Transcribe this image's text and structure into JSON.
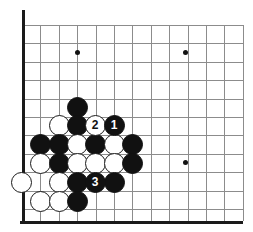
{
  "figure": {
    "kind": "go-board-diagram",
    "board_size_visible": {
      "cols": 13,
      "rows": 11
    },
    "colors": {
      "background": "#ffffff",
      "grid_line": "#8c8c8c",
      "board_edge": "#1a1a1a",
      "black_stone": "#111111",
      "white_stone": "#ffffff",
      "white_stone_outline": "#1a1a1a",
      "star_point": "#111111"
    },
    "geometry": {
      "origin_x": 22,
      "origin_y": 25,
      "spacing": 18.4,
      "stone_diameter": 21,
      "left_edge_x": 22,
      "bottom_edge_y": 221,
      "cols": 13,
      "rows": 11
    }
  },
  "grid": {
    "columns_x": [
      22,
      40.4,
      58.8,
      77.2,
      95.6,
      114,
      132.4,
      150.8,
      169.2,
      187.6,
      206,
      224.4,
      242.8
    ],
    "rows_y": [
      25,
      43.4,
      61.8,
      80.2,
      98.6,
      117,
      135.4,
      153.8,
      172.2,
      190.6,
      209
    ]
  },
  "edges": {
    "left": {
      "x": 22,
      "y_top": 10,
      "y_bottom": 224
    },
    "bottom": {
      "y": 221,
      "x_left": 20,
      "x_right": 243
    }
  },
  "star_points": [
    {
      "label": "star-4-4-top-left",
      "col": 3,
      "row": 1,
      "x": 77,
      "y": 52
    },
    {
      "label": "star-top-right",
      "col": 9,
      "row": 1,
      "x": 185,
      "y": 52
    },
    {
      "label": "star-lower-right",
      "col": 9,
      "row": 7,
      "x": 185,
      "y": 162
    }
  ],
  "stones": [
    {
      "name": "black-stone",
      "color": "black",
      "x": 77,
      "y": 107,
      "label": ""
    },
    {
      "name": "white-stone",
      "color": "white",
      "x": 59,
      "y": 125,
      "label": ""
    },
    {
      "name": "black-stone",
      "color": "black",
      "x": 77,
      "y": 125,
      "label": ""
    },
    {
      "name": "white-stone-move-2",
      "color": "white",
      "x": 95,
      "y": 125,
      "label": "2"
    },
    {
      "name": "black-stone-move-1",
      "color": "black",
      "x": 114,
      "y": 125,
      "label": "1"
    },
    {
      "name": "black-stone",
      "color": "black",
      "x": 40,
      "y": 144,
      "label": ""
    },
    {
      "name": "black-stone",
      "color": "black",
      "x": 59,
      "y": 144,
      "label": ""
    },
    {
      "name": "white-stone",
      "color": "white",
      "x": 77,
      "y": 144,
      "label": ""
    },
    {
      "name": "black-stone",
      "color": "black",
      "x": 95,
      "y": 144,
      "label": ""
    },
    {
      "name": "white-stone",
      "color": "white",
      "x": 114,
      "y": 144,
      "label": ""
    },
    {
      "name": "black-stone",
      "color": "black",
      "x": 132,
      "y": 144,
      "label": ""
    },
    {
      "name": "white-stone",
      "color": "white",
      "x": 40,
      "y": 163,
      "label": ""
    },
    {
      "name": "black-stone",
      "color": "black",
      "x": 59,
      "y": 163,
      "label": ""
    },
    {
      "name": "white-stone",
      "color": "white",
      "x": 77,
      "y": 163,
      "label": ""
    },
    {
      "name": "white-stone",
      "color": "white",
      "x": 95,
      "y": 163,
      "label": ""
    },
    {
      "name": "white-stone",
      "color": "white",
      "x": 114,
      "y": 163,
      "label": ""
    },
    {
      "name": "black-stone",
      "color": "black",
      "x": 132,
      "y": 163,
      "label": ""
    },
    {
      "name": "white-stone",
      "color": "white",
      "x": 21,
      "y": 182,
      "label": ""
    },
    {
      "name": "white-stone",
      "color": "white",
      "x": 59,
      "y": 182,
      "label": ""
    },
    {
      "name": "black-stone",
      "color": "black",
      "x": 77,
      "y": 182,
      "label": ""
    },
    {
      "name": "black-stone-move-3",
      "color": "black",
      "x": 95,
      "y": 182,
      "label": "3"
    },
    {
      "name": "black-stone",
      "color": "black",
      "x": 114,
      "y": 182,
      "label": ""
    },
    {
      "name": "white-stone",
      "color": "white",
      "x": 40,
      "y": 201,
      "label": ""
    },
    {
      "name": "white-stone",
      "color": "white",
      "x": 59,
      "y": 201,
      "label": ""
    },
    {
      "name": "black-stone",
      "color": "black",
      "x": 77,
      "y": 201,
      "label": ""
    }
  ],
  "move_sequence": [
    {
      "number": "1",
      "color": "black"
    },
    {
      "number": "2",
      "color": "white"
    },
    {
      "number": "3",
      "color": "black"
    }
  ]
}
